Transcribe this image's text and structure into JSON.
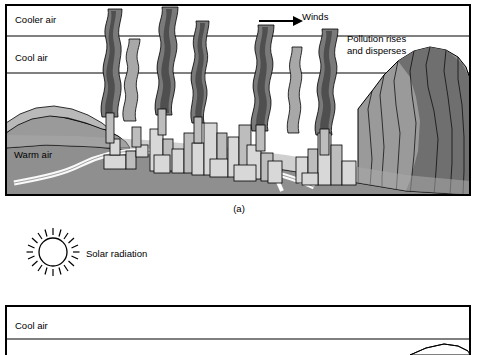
{
  "figure": {
    "caption_a": "(a)"
  },
  "panel_a": {
    "labels": {
      "cooler_air": "Cooler air",
      "cool_air": "Cool air",
      "warm_air": "Warm air",
      "winds": "Winds",
      "pollution_line1": "Pollution rises",
      "pollution_line2": "and disperses"
    },
    "icons": {
      "wind_arrow": "right-arrow-icon"
    }
  },
  "legend": {
    "solar_radiation": "Solar radiation",
    "sun_icon": "sun-icon"
  },
  "panel_b": {
    "labels": {
      "cool_air": "Cool air"
    }
  },
  "colors": {
    "outline": "#000000",
    "background": "#ffffff",
    "ground_light": "#b9b9b9",
    "ground_mid": "#9a9a9a",
    "ground_dark": "#6f6f6f",
    "smoke_dark": "#4f4f4f",
    "smoke_mid": "#7a7a7a",
    "smoke_light": "#a8a8a8",
    "building_light": "#d8d8d8",
    "building_mid": "#bdbdbd"
  }
}
